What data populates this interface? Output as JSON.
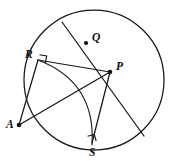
{
  "figure": {
    "kind": "circle-geometry-diagram",
    "background_color": "#ffffff",
    "stroke_color": "#161616",
    "label_color": "#0d0d0d",
    "width": 174,
    "height": 161
  },
  "labels": {
    "center": "P",
    "chord_point": "Q",
    "tangent_point_upper": "R",
    "tangent_point_lower": "S",
    "external_point": "A"
  },
  "points": {
    "P": {
      "x": 110,
      "y": 72,
      "label_dx": 6,
      "label_dy": -11
    },
    "Q": {
      "x": 86,
      "y": 43,
      "label_dx": 6,
      "label_dy": -11
    },
    "R": {
      "x": 38,
      "y": 60,
      "label_dx": -13,
      "label_dy": -11
    },
    "S": {
      "x": 92,
      "y": 145,
      "label_dx": -3,
      "label_dy": 2
    },
    "A": {
      "x": 19,
      "y": 125,
      "label_dx": -12,
      "label_dy": -6
    }
  },
  "circle": {
    "center_x": 94,
    "center_y": 80,
    "radius": 70
  },
  "arc": {
    "description": "arc from R to S centered at A",
    "center_x": 19,
    "center_y": 125,
    "radius": 67
  },
  "segments": [
    {
      "name": "chord-through-Q-and-P",
      "from": "circle-top-left",
      "to": "circle-bottom-right"
    },
    {
      "name": "segment-R-to-P",
      "from": "R",
      "to": "P"
    },
    {
      "name": "segment-A-to-R",
      "from": "A",
      "to": "R"
    },
    {
      "name": "segment-A-to-P",
      "from": "A",
      "to": "P"
    },
    {
      "name": "segment-P-to-S",
      "from": "P",
      "to": "S"
    }
  ],
  "right_angle_marks": [
    {
      "name": "right-angle-at-R",
      "at": "R"
    },
    {
      "name": "right-angle-at-S",
      "at": "S"
    }
  ]
}
